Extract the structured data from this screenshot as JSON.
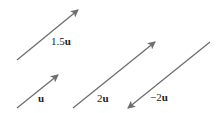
{
  "diagram": {
    "stroke_color": "#6e6e6e",
    "vectors": [
      {
        "name": "1.5u",
        "scalar": "1.5",
        "symbol": "u",
        "x1": 17,
        "y1": 60,
        "x2": 78,
        "y2": 10,
        "label_x": 51,
        "label_y": 45
      },
      {
        "name": "u",
        "scalar": "",
        "symbol": "u",
        "x1": 17,
        "y1": 108,
        "x2": 58,
        "y2": 75,
        "label_x": 38,
        "label_y": 102
      },
      {
        "name": "2u",
        "scalar": "2",
        "symbol": "u",
        "x1": 73,
        "y1": 108,
        "x2": 155,
        "y2": 42,
        "label_x": 97,
        "label_y": 102
      },
      {
        "name": "-2u",
        "scalar": "−2",
        "symbol": "u",
        "x1": 210,
        "y1": 42,
        "x2": 128,
        "y2": 108,
        "label_x": 150,
        "label_y": 101
      }
    ]
  }
}
